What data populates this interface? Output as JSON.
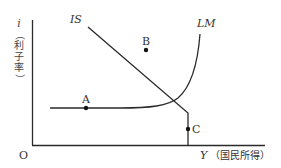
{
  "diagram": {
    "axes": {
      "y_label": "i",
      "y_label_note": [
        "（",
        "利",
        "子",
        "率",
        "）"
      ],
      "x_label": "Y",
      "x_label_note": "（国民所得）",
      "origin": "O"
    },
    "curves": {
      "is_label": "IS",
      "lm_label": "LM"
    },
    "points": {
      "a": "A",
      "b": "B",
      "c": "C"
    },
    "colors": {
      "line": "#2a2a2a",
      "text": "#333333"
    }
  }
}
